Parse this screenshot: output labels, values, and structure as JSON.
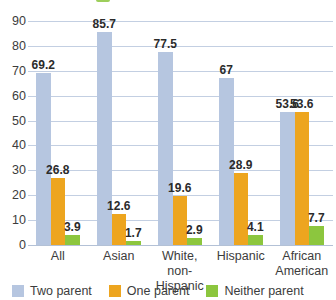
{
  "chart_data": {
    "type": "bar",
    "title": "",
    "xlabel": "",
    "ylabel": "",
    "ylim": [
      0,
      90
    ],
    "yticks": [
      0,
      10,
      20,
      30,
      40,
      50,
      60,
      70,
      80,
      90
    ],
    "grid": true,
    "legend_position": "bottom",
    "categories": [
      "All",
      "Asian",
      "White,\nnon-Hispanic",
      "Hispanic",
      "African\nAmerican"
    ],
    "series": [
      {
        "name": "Two parent",
        "color": "#b6c6e0",
        "values": [
          69.2,
          85.7,
          77.5,
          67,
          53.6
        ],
        "labels": [
          "69.2",
          "85.7",
          "77.5",
          "67",
          "53.6"
        ]
      },
      {
        "name": "One parent",
        "color": "#eda51f",
        "values": [
          26.8,
          12.6,
          19.6,
          28.9,
          53.6
        ],
        "labels": [
          "26.8",
          "12.6",
          "19.6",
          "28.9",
          "53.6"
        ]
      },
      {
        "name": "Neither parent",
        "color": "#8cc63e",
        "values": [
          3.9,
          1.7,
          2.9,
          4.1,
          7.7
        ],
        "labels": [
          "3.9",
          "1.7",
          "2.9",
          "4.1",
          "7.7"
        ]
      }
    ]
  },
  "legend": {
    "items": [
      {
        "label": "Two parent",
        "color": "#b6c6e0"
      },
      {
        "label": "One parent",
        "color": "#eda51f"
      },
      {
        "label": "Neither parent",
        "color": "#8cc63e"
      }
    ]
  },
  "colors": {
    "two_parent": "#b6c6e0",
    "one_parent": "#eda51f",
    "neither_parent": "#8cc63e",
    "gridline": "#c3cfe2",
    "tick_text": "#3c3c3c",
    "value_label": "#2b2b2b"
  }
}
